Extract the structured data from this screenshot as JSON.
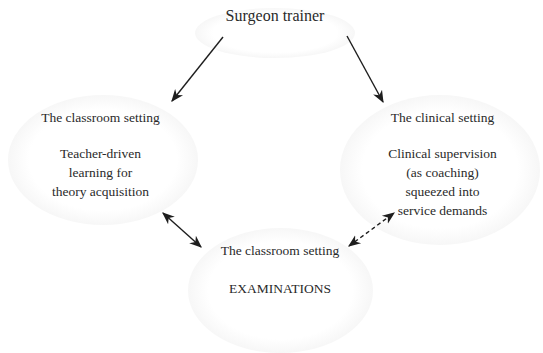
{
  "diagram": {
    "root": {
      "label": "Surgeon trainer"
    },
    "nodes": [
      {
        "id": "classroom-left",
        "heading": "The classroom setting",
        "lines": [
          "Teacher-driven",
          "learning for",
          "theory acquisition"
        ]
      },
      {
        "id": "clinical-right",
        "heading": "The clinical setting",
        "lines": [
          "Clinical supervision",
          "(as coaching)",
          "squeezed into",
          "service demands"
        ]
      },
      {
        "id": "classroom-bottom",
        "heading": "The classroom setting",
        "lines": [
          "EXAMINATIONS"
        ]
      }
    ],
    "edges": [
      {
        "from": "root",
        "to": "classroom-left",
        "style": "solid",
        "direction": "forward"
      },
      {
        "from": "root",
        "to": "clinical-right",
        "style": "solid",
        "direction": "forward"
      },
      {
        "from": "classroom-left",
        "to": "classroom-bottom",
        "style": "solid",
        "direction": "both"
      },
      {
        "from": "clinical-right",
        "to": "classroom-bottom",
        "style": "dashed",
        "direction": "both"
      }
    ],
    "colors": {
      "text": "#2a2a2a",
      "arrow": "#1e1e1e",
      "blob_edge": "#f4f4f4",
      "background": "#ffffff"
    }
  }
}
